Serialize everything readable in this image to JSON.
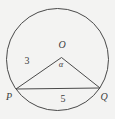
{
  "figure": {
    "background": "#f3f3f2",
    "line_color": "#4a4a4a",
    "circle": {
      "cx": 57.5,
      "cy": 59.5,
      "r": 51
    },
    "vertices": {
      "O": {
        "x": 61.5,
        "y": 57.5
      },
      "P": {
        "x": 16,
        "y": 89
      },
      "Q": {
        "x": 100,
        "y": 88
      }
    },
    "labels": [
      {
        "name": "point-label-O",
        "text": "O",
        "x": 62,
        "y": 45,
        "style": "italic"
      },
      {
        "name": "angle-label-alpha",
        "text": "α",
        "x": 61,
        "y": 64,
        "style": "italic small"
      },
      {
        "name": "side-label-OP",
        "text": "3",
        "x": 27,
        "y": 61,
        "style": ""
      },
      {
        "name": "side-label-PQ",
        "text": "5",
        "x": 63,
        "y": 99,
        "style": ""
      },
      {
        "name": "point-label-P",
        "text": "P",
        "x": 9,
        "y": 97,
        "style": "italic"
      },
      {
        "name": "point-label-Q",
        "text": "Q",
        "x": 104,
        "y": 97,
        "style": "italic"
      }
    ]
  }
}
